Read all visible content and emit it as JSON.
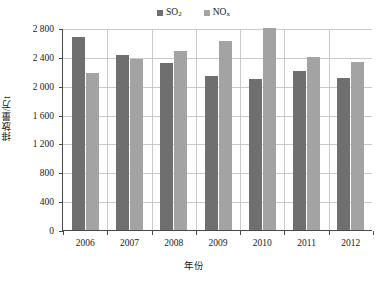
{
  "chart_data": {
    "type": "bar",
    "title": "",
    "subtitle": "",
    "xlabel": "年份",
    "ylabel": "排放量/万t",
    "categories": [
      "2006",
      "2007",
      "2008",
      "2009",
      "2010",
      "2011",
      "2012"
    ],
    "series": [
      {
        "name": "SO2",
        "name_html": "SO<sub>2</sub>",
        "color": "#6f6f6f",
        "values": [
          2680,
          2430,
          2320,
          2140,
          2090,
          2210,
          2110
        ]
      },
      {
        "name": "NOx",
        "name_html": "NO<sub>x</sub>",
        "color": "#a3a3a3",
        "values": [
          2170,
          2370,
          2480,
          2620,
          2800,
          2400,
          2330
        ]
      }
    ],
    "ylim": [
      0,
      2800
    ],
    "ytick_values": [
      0,
      400,
      800,
      1200,
      1600,
      2000,
      2400,
      2800
    ],
    "ytick_labels": [
      "0",
      "400",
      "800",
      "1 200",
      "1 600",
      "2 000",
      "2 400",
      "2 800"
    ],
    "grid": {
      "horizontal": true,
      "vertical": true
    },
    "legend": {
      "position": "top-center",
      "entries": [
        "SO2",
        "NOx"
      ]
    }
  },
  "legend": {
    "items": [
      {
        "label": "SO",
        "sub": "2",
        "color": "#6f6f6f",
        "name": "so2"
      },
      {
        "label": "NO",
        "sub": "x",
        "color": "#a3a3a3",
        "name": "nox"
      }
    ]
  },
  "axes": {
    "y_title": "排放量/万t",
    "x_title": "年份"
  },
  "colors": {
    "series_so2": "#6f6f6f",
    "series_nox": "#a3a3a3",
    "axis": "#4a4a4a",
    "grid": "#c9c9c9",
    "background": "#ffffff"
  }
}
